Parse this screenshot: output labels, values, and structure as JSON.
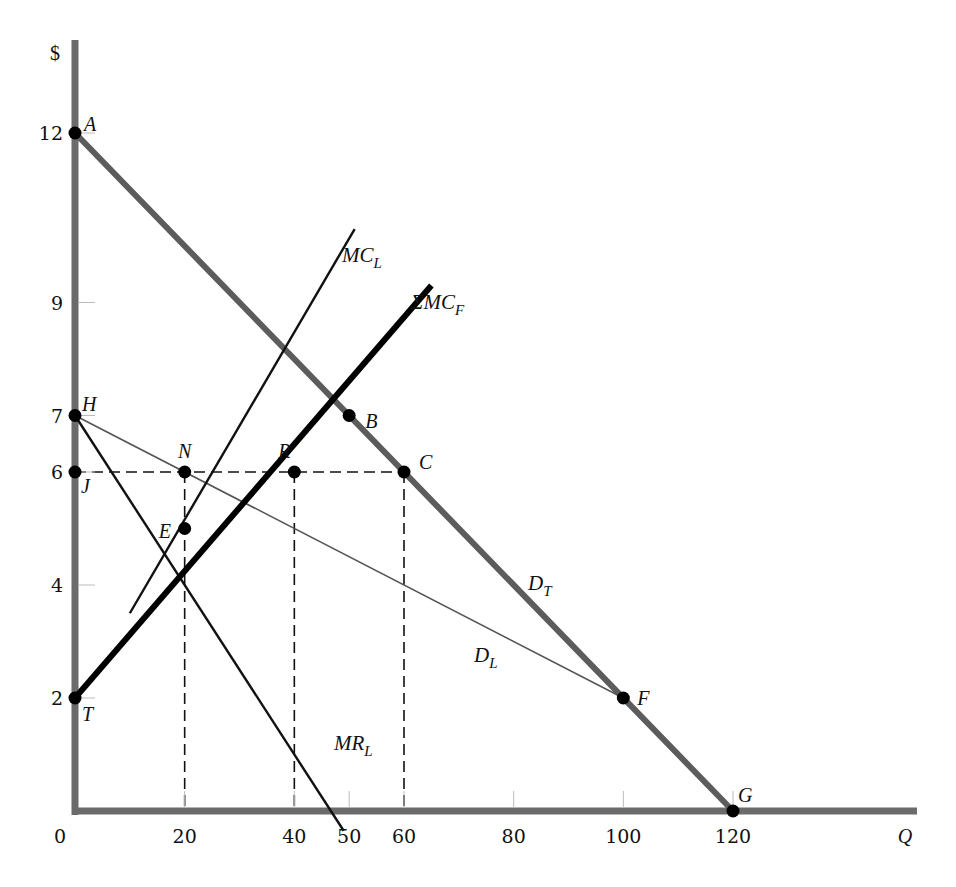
{
  "chart_data": {
    "type": "line",
    "title": "",
    "xlabel": "Q",
    "ylabel": "$",
    "xlim": [
      0,
      150
    ],
    "ylim": [
      0,
      13.5
    ],
    "grid": false,
    "legend": "none (curves labeled inline)",
    "x_ticks": [
      0,
      20,
      40,
      50,
      60,
      80,
      100,
      120
    ],
    "y_ticks": [
      2,
      4,
      6,
      7,
      9,
      12
    ],
    "series": [
      {
        "name": "D_T",
        "label": "D",
        "sub": "T",
        "style": "thick gray",
        "points": [
          [
            0,
            12
          ],
          [
            120,
            0
          ]
        ]
      },
      {
        "name": "D_L",
        "label": "D",
        "sub": "L",
        "style": "thin gray",
        "points": [
          [
            0,
            7
          ],
          [
            100,
            2
          ]
        ]
      },
      {
        "name": "MR_L",
        "label": "MR",
        "sub": "L",
        "style": "medium black",
        "points": [
          [
            0,
            7
          ],
          [
            49,
            -0.35
          ]
        ]
      },
      {
        "name": "MC_L",
        "label": "MC",
        "sub": "L",
        "style": "medium black",
        "points": [
          [
            10,
            3.5
          ],
          [
            51,
            10.3
          ]
        ]
      },
      {
        "name": "ΣMC_F",
        "label": "ΣMC",
        "sub": "F",
        "style": "thick black",
        "points": [
          [
            0,
            2
          ],
          [
            65,
            9.3
          ]
        ]
      }
    ],
    "points": [
      {
        "label": "A",
        "x": 0,
        "y": 12
      },
      {
        "label": "B",
        "x": 50,
        "y": 7
      },
      {
        "label": "C",
        "x": 60,
        "y": 6
      },
      {
        "label": "E",
        "x": 20,
        "y": 5
      },
      {
        "label": "F",
        "x": 100,
        "y": 2
      },
      {
        "label": "G",
        "x": 120,
        "y": 0
      },
      {
        "label": "H",
        "x": 0,
        "y": 7
      },
      {
        "label": "J",
        "x": 0,
        "y": 6
      },
      {
        "label": "N",
        "x": 20,
        "y": 6
      },
      {
        "label": "R",
        "x": 40,
        "y": 6
      },
      {
        "label": "T",
        "x": 0,
        "y": 2
      }
    ],
    "dashed_guides": [
      {
        "from": [
          0,
          6
        ],
        "to": [
          60,
          6
        ]
      },
      {
        "from": [
          20,
          6
        ],
        "to": [
          20,
          0
        ]
      },
      {
        "from": [
          40,
          6
        ],
        "to": [
          40,
          0
        ]
      },
      {
        "from": [
          60,
          6
        ],
        "to": [
          60,
          0
        ]
      }
    ]
  }
}
